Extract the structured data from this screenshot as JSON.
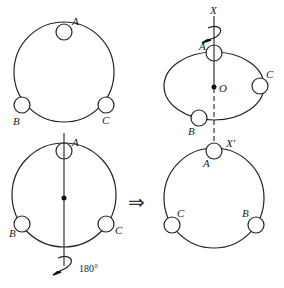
{
  "diagram": {
    "panels": {
      "top_left": {
        "description": "Ring with three beads A, B, C",
        "labels": {
          "a": "A",
          "b": "B",
          "c": "C"
        }
      },
      "bottom_left": {
        "description": "Same ring with vertical axis through A and center, rotated 180°",
        "labels": {
          "a": "A",
          "b": "B",
          "c": "C"
        },
        "rotation_label": "180°"
      },
      "top_right": {
        "description": "Ring shown in perspective rotating about axis XX' through O",
        "labels": {
          "axis_top": "X",
          "a": "A",
          "b": "B",
          "c": "C",
          "center": "O"
        }
      },
      "bottom_right": {
        "description": "Resulting ring after 180° rotation, B and C swapped",
        "labels": {
          "axis_bottom": "X′",
          "a": "A",
          "b": "B",
          "c": "C"
        }
      }
    },
    "implies_arrow": "⇒",
    "colors": {
      "stroke": "#222222",
      "background": "#ffffff"
    }
  }
}
